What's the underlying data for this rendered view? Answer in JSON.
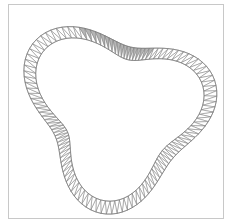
{
  "diagram": {
    "title": "",
    "type": "triangulated-annulus",
    "frame": {
      "x": 8.5,
      "y": 4.5,
      "width": 215,
      "height": 214,
      "stroke": "#c8c8c8"
    },
    "center": {
      "x": 117,
      "y": 112
    },
    "shape": {
      "base_radius": 80,
      "lobes": 3,
      "lobe_amplitude": 18,
      "lobe_phase_deg": -20,
      "second_harmonic_amplitude": 4,
      "second_harmonic_phase_deg": 40,
      "band_width": 13
    },
    "segments": 120,
    "edge_color": "#7a7a7a",
    "fill_color": "#ffffff",
    "highlight_color": "#b4b4b4",
    "highlight_range_deg": [
      -115,
      -60
    ]
  }
}
